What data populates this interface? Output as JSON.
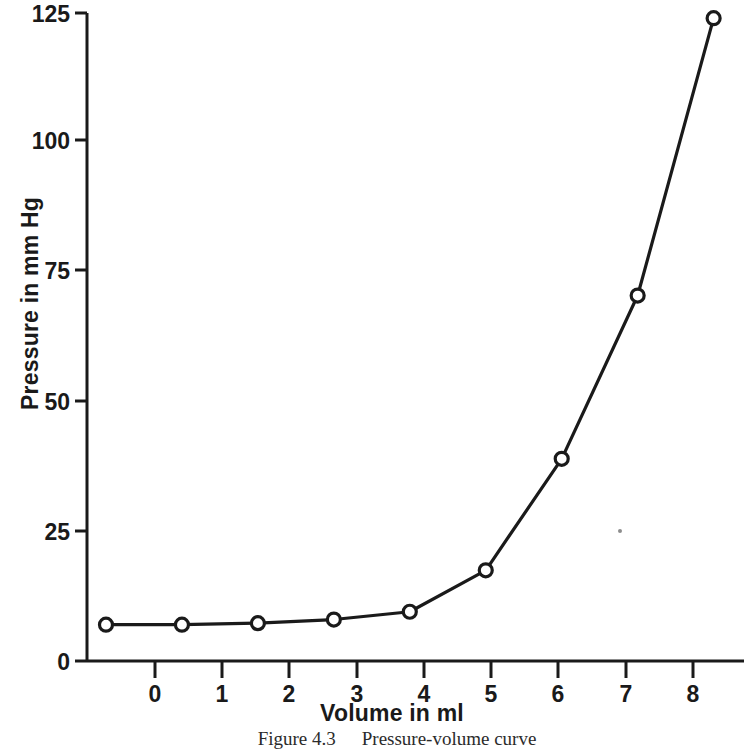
{
  "chart_data": {
    "type": "line",
    "title": "",
    "xlabel": "Volume in ml",
    "ylabel": "Pressure in mm Hg",
    "x": [
      0,
      1,
      2,
      3,
      4,
      5,
      6,
      7,
      8
    ],
    "values": [
      7,
      7,
      7.3,
      8,
      9.5,
      17.5,
      39,
      70.5,
      124
    ],
    "series": [
      {
        "name": "Pressure",
        "values": [
          7,
          7,
          7.3,
          8,
          9.5,
          17.5,
          39,
          70.5,
          124
        ]
      }
    ],
    "xlim": [
      -0.25,
      8.4
    ],
    "ylim": [
      0,
      125
    ],
    "xticks": [
      0,
      1,
      2,
      3,
      4,
      5,
      6,
      7,
      8
    ],
    "yticks": [
      0,
      25,
      50,
      75,
      100,
      125
    ],
    "xtick_labels": [
      "0",
      "1",
      "2",
      "3",
      "4",
      "5",
      "6",
      "7",
      "8"
    ],
    "ytick_labels": [
      "0",
      "25",
      "50",
      "75",
      "100",
      "125"
    ],
    "grid": false,
    "legend": false,
    "legend_position": "none",
    "marker": "open-circle",
    "line_color": "#1a1a1a",
    "marker_face_color": "#ffffff",
    "background_color": "#ffffff"
  },
  "caption": {
    "number": "Figure 4.3",
    "text": "Pressure-volume curve"
  }
}
